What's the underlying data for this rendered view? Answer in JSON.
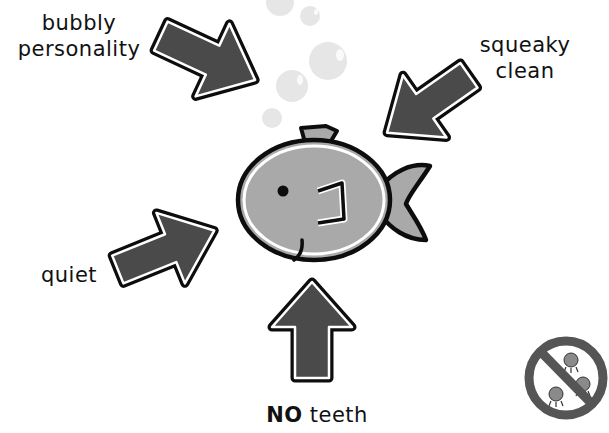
{
  "illustration": {
    "subject": "fish",
    "colors": {
      "arrow_fill": "#4a4a4a",
      "outline": "#0d0d0d",
      "fish_body": "#a9a9a9",
      "bubble": "#e6e6e6",
      "no_sign": "#555555",
      "germ": "#888888"
    }
  },
  "labels": {
    "bubbly": {
      "line1": "bubbly",
      "line2": "personality"
    },
    "squeaky": {
      "line1": "squeaky",
      "line2": "clean"
    },
    "quiet": {
      "text": "quiet"
    },
    "teeth": {
      "strong": "NO",
      "rest": " teeth"
    }
  },
  "icons": {
    "no_germs": "no-germs-icon"
  }
}
